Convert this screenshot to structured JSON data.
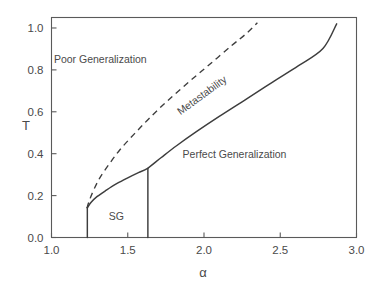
{
  "chart_data": {
    "type": "line",
    "title": "",
    "xlabel": "α",
    "ylabel": "T",
    "xlim": [
      1.0,
      3.0
    ],
    "ylim": [
      0.0,
      1.05
    ],
    "xticks": [
      1.0,
      1.5,
      2.0,
      2.5,
      3.0
    ],
    "xticklabels": [
      "1.0",
      "1.5",
      "2.0",
      "2.5",
      "3.0"
    ],
    "yticks": [
      0.0,
      0.2,
      0.4,
      0.6,
      0.8,
      1.0
    ],
    "yticklabels": [
      "0.0",
      "0.2",
      "0.4",
      "0.6",
      "0.8",
      "1.0"
    ],
    "grid": false,
    "legend": "none",
    "frame": "box",
    "series": [
      {
        "name": "Perfect generalization transition (solid)",
        "style": "solid",
        "x": [
          1.235,
          1.26,
          1.3,
          1.36,
          1.43,
          1.5,
          1.57,
          1.63,
          1.72,
          1.82,
          1.95,
          2.1,
          2.28,
          2.45,
          2.62,
          2.78,
          2.87
        ],
        "y": [
          0.142,
          0.168,
          0.196,
          0.226,
          0.258,
          0.285,
          0.31,
          0.33,
          0.382,
          0.438,
          0.505,
          0.578,
          0.662,
          0.742,
          0.82,
          0.902,
          1.02
        ]
      },
      {
        "name": "Metastability boundary (dashed)",
        "style": "dashed",
        "x": [
          1.232,
          1.25,
          1.28,
          1.32,
          1.38,
          1.45,
          1.54,
          1.64,
          1.76,
          1.9,
          2.04,
          2.18,
          2.28,
          2.35
        ],
        "y": [
          0.14,
          0.18,
          0.232,
          0.288,
          0.352,
          0.42,
          0.492,
          0.568,
          0.652,
          0.742,
          0.828,
          0.915,
          0.975,
          1.025
        ]
      },
      {
        "name": "SG left vertical boundary",
        "style": "solid",
        "x": [
          1.235,
          1.235
        ],
        "y": [
          0.0,
          0.142
        ]
      },
      {
        "name": "SG right vertical boundary",
        "style": "solid",
        "x": [
          1.632,
          1.632
        ],
        "y": [
          0.0,
          0.33
        ]
      }
    ],
    "annotations": [
      {
        "text": "Poor Generalization",
        "x": 1.32,
        "y": 0.835,
        "rotation": 0
      },
      {
        "text": "Metastability",
        "x": 2.0,
        "y": 0.665,
        "rotation": -36
      },
      {
        "text": "Perfect Generalization",
        "x": 2.2,
        "y": 0.38,
        "rotation": 0
      },
      {
        "text": "SG",
        "x": 1.425,
        "y": 0.085,
        "rotation": 0
      }
    ]
  },
  "axes": {
    "ylabel": "T",
    "xlabel": "α"
  },
  "colors": {
    "background": "#ffffff",
    "line": "#3d3d3d",
    "frame": "#5a5a5a",
    "text": "#4a4a4a"
  }
}
